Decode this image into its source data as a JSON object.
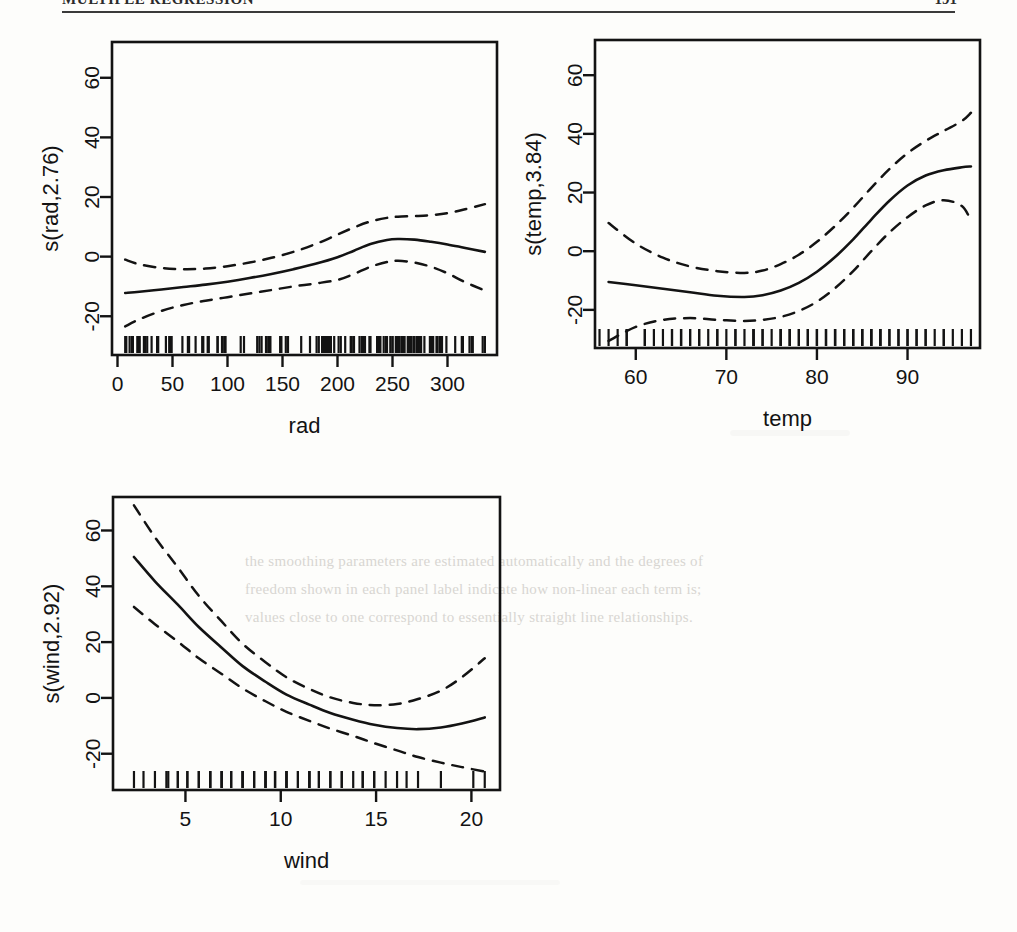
{
  "page": {
    "running_header": "MULTIPLE REGRESSION",
    "page_number": "191",
    "bleed_text_line1": "the smoothing parameters are estimated automatically and the degrees of",
    "bleed_text_line2": "freedom shown in each panel label indicate how non-linear each term is;",
    "bleed_text_line3": "values close to one correspond to essentially straight line relationships."
  },
  "chart_data": [
    {
      "type": "line",
      "id": "rad-panel",
      "title": "",
      "xlabel": "rad",
      "ylabel": "s(rad,2.76)",
      "xlim": [
        -5,
        345
      ],
      "ylim": [
        -33,
        72
      ],
      "xticks": [
        0,
        50,
        100,
        150,
        200,
        250,
        300
      ],
      "yticks": [
        -20,
        0,
        20,
        40,
        60
      ],
      "grid": false,
      "legend": "none",
      "rug": true,
      "series": [
        {
          "name": "smooth",
          "style": "solid",
          "x": [
            7,
            20,
            40,
            60,
            80,
            100,
            120,
            140,
            160,
            180,
            200,
            215,
            230,
            245,
            255,
            270,
            285,
            300,
            315,
            334
          ],
          "y": [
            -12.2,
            -11.8,
            -11.0,
            -10.2,
            -9.4,
            -8.4,
            -7.2,
            -5.8,
            -4.2,
            -2.4,
            -0.2,
            2.0,
            4.2,
            5.6,
            5.9,
            5.7,
            5.0,
            4.1,
            3.0,
            1.6
          ]
        },
        {
          "name": "upper-se",
          "style": "dashed",
          "x": [
            7,
            20,
            40,
            60,
            80,
            100,
            120,
            140,
            160,
            180,
            200,
            215,
            230,
            245,
            255,
            270,
            285,
            300,
            315,
            334
          ],
          "y": [
            -1.0,
            -2.6,
            -3.8,
            -4.2,
            -4.0,
            -3.2,
            -2.0,
            -0.4,
            1.6,
            4.2,
            7.4,
            9.8,
            11.8,
            13.0,
            13.4,
            13.6,
            13.9,
            14.6,
            15.8,
            17.6
          ]
        },
        {
          "name": "lower-se",
          "style": "dashed",
          "x": [
            7,
            20,
            40,
            60,
            80,
            100,
            120,
            140,
            160,
            180,
            200,
            215,
            230,
            245,
            255,
            270,
            285,
            300,
            315,
            334
          ],
          "y": [
            -23.4,
            -21.0,
            -18.2,
            -16.2,
            -14.8,
            -13.6,
            -12.4,
            -11.2,
            -10.0,
            -9.0,
            -7.8,
            -5.8,
            -3.4,
            -1.8,
            -1.4,
            -2.0,
            -3.4,
            -5.6,
            -8.4,
            -11.4
          ]
        }
      ]
    },
    {
      "type": "line",
      "id": "temp-panel",
      "title": "",
      "xlabel": "temp",
      "ylabel": "s(temp,3.84)",
      "xlim": [
        55.5,
        98
      ],
      "ylim": [
        -33,
        72
      ],
      "xticks": [
        60,
        70,
        80,
        90
      ],
      "yticks": [
        -20,
        0,
        20,
        40,
        60
      ],
      "grid": false,
      "legend": "none",
      "rug": true,
      "series": [
        {
          "name": "smooth",
          "style": "solid",
          "x": [
            57,
            60,
            63,
            66,
            69,
            72,
            74,
            76,
            78,
            80,
            82,
            84,
            86,
            88,
            90,
            92,
            94,
            96,
            97
          ],
          "y": [
            -10.5,
            -11.6,
            -12.8,
            -14.0,
            -15.2,
            -15.6,
            -15.0,
            -13.4,
            -10.8,
            -7.0,
            -2.0,
            4.0,
            10.8,
            17.2,
            22.4,
            25.8,
            27.6,
            28.6,
            28.9
          ]
        },
        {
          "name": "upper-se",
          "style": "dashed",
          "x": [
            57,
            60,
            63,
            66,
            69,
            72,
            74,
            76,
            78,
            80,
            82,
            84,
            86,
            88,
            90,
            92,
            94,
            96,
            97
          ],
          "y": [
            9.6,
            2.6,
            -2.2,
            -5.2,
            -6.8,
            -7.4,
            -6.6,
            -4.4,
            -1.2,
            3.2,
            8.6,
            14.8,
            21.6,
            28.0,
            33.4,
            37.6,
            41.0,
            44.4,
            47.2
          ]
        },
        {
          "name": "lower-se",
          "style": "dashed",
          "x": [
            57,
            60,
            63,
            66,
            69,
            72,
            74,
            76,
            78,
            80,
            82,
            84,
            86,
            88,
            90,
            92,
            94,
            96,
            97
          ],
          "y": [
            -30.6,
            -25.8,
            -23.4,
            -22.8,
            -23.4,
            -23.8,
            -23.4,
            -22.4,
            -20.4,
            -17.2,
            -12.6,
            -6.8,
            0.0,
            6.4,
            11.6,
            15.6,
            17.4,
            15.4,
            10.4
          ]
        }
      ]
    },
    {
      "type": "line",
      "id": "wind-panel",
      "title": "",
      "xlabel": "wind",
      "ylabel": "s(wind,2.92)",
      "xlim": [
        1.2,
        21.5
      ],
      "ylim": [
        -33,
        72
      ],
      "xticks": [
        5,
        10,
        15,
        20
      ],
      "yticks": [
        -20,
        0,
        20,
        40,
        60
      ],
      "grid": false,
      "legend": "none",
      "rug": true,
      "series": [
        {
          "name": "smooth",
          "style": "solid",
          "x": [
            2.3,
            3.4,
            4.6,
            5.7,
            6.9,
            8.0,
            9.2,
            10.3,
            11.5,
            12.6,
            13.8,
            14.9,
            16.1,
            17.2,
            18.4,
            19.5,
            20.7
          ],
          "y": [
            50.5,
            41.8,
            33.4,
            25.4,
            18.0,
            11.4,
            5.8,
            1.2,
            -2.4,
            -5.4,
            -7.8,
            -9.6,
            -10.8,
            -11.2,
            -10.6,
            -9.2,
            -7.0
          ]
        },
        {
          "name": "upper-se",
          "style": "dashed",
          "x": [
            2.3,
            3.4,
            4.6,
            5.7,
            6.9,
            8.0,
            9.2,
            10.3,
            11.5,
            12.6,
            13.8,
            14.9,
            16.1,
            17.2,
            18.4,
            19.5,
            20.7
          ],
          "y": [
            69.0,
            57.6,
            46.8,
            36.6,
            27.4,
            19.4,
            12.8,
            7.4,
            3.2,
            0.2,
            -1.8,
            -2.6,
            -2.2,
            -0.4,
            2.6,
            7.4,
            14.2
          ]
        },
        {
          "name": "lower-se",
          "style": "dashed",
          "x": [
            2.3,
            3.4,
            4.6,
            5.7,
            6.9,
            8.0,
            9.2,
            10.3,
            11.5,
            12.6,
            13.8,
            14.9,
            16.1,
            17.2,
            18.4,
            19.5,
            20.7
          ],
          "y": [
            32.6,
            26.4,
            20.2,
            14.2,
            8.6,
            3.4,
            -1.2,
            -5.0,
            -8.2,
            -11.0,
            -13.6,
            -16.2,
            -18.8,
            -21.2,
            -23.2,
            -24.8,
            -26.4
          ]
        }
      ]
    }
  ],
  "rug_values": {
    "rad": [
      7,
      8,
      11,
      13,
      14,
      18,
      19,
      20,
      20,
      24,
      25,
      25,
      27,
      31,
      36,
      37,
      44,
      47,
      48,
      49,
      49,
      59,
      64,
      65,
      65,
      71,
      77,
      78,
      82,
      83,
      91,
      91,
      95,
      97,
      98,
      98,
      112,
      115,
      127,
      129,
      131,
      135,
      137,
      138,
      139,
      148,
      148,
      149,
      153,
      155,
      167,
      175,
      181,
      183,
      186,
      187,
      188,
      189,
      190,
      191,
      192,
      193,
      194,
      197,
      201,
      203,
      207,
      212,
      213,
      215,
      220,
      222,
      223,
      224,
      225,
      229,
      230,
      236,
      237,
      238,
      238,
      239,
      242,
      244,
      245,
      248,
      250,
      250,
      253,
      254,
      255,
      256,
      258,
      259,
      259,
      260,
      261,
      264,
      264,
      266,
      267,
      269,
      270,
      272,
      273,
      273,
      274,
      275,
      276,
      279,
      284,
      285,
      286,
      287,
      290,
      291,
      293,
      294,
      294,
      295,
      299,
      307,
      313,
      314,
      320,
      322,
      323,
      332,
      334
    ],
    "temp": [
      56,
      57,
      58,
      59,
      59,
      61,
      61,
      62,
      63,
      64,
      64,
      65,
      65,
      65,
      66,
      66,
      67,
      67,
      68,
      69,
      69,
      70,
      71,
      71,
      72,
      73,
      73,
      73,
      74,
      74,
      75,
      76,
      76,
      76,
      77,
      77,
      77,
      78,
      78,
      79,
      79,
      79,
      80,
      80,
      80,
      81,
      81,
      81,
      82,
      82,
      82,
      82,
      83,
      83,
      83,
      84,
      84,
      84,
      85,
      85,
      85,
      86,
      86,
      86,
      87,
      87,
      87,
      88,
      88,
      89,
      89,
      90,
      90,
      91,
      91,
      92,
      92,
      93,
      94,
      94,
      95,
      96,
      97
    ],
    "wind": [
      2.3,
      2.8,
      3.4,
      4.0,
      4.1,
      4.6,
      4.6,
      5.1,
      5.1,
      5.7,
      5.7,
      6.3,
      6.3,
      6.3,
      6.9,
      6.9,
      6.9,
      7.4,
      7.4,
      8.0,
      8.0,
      8.0,
      8.6,
      8.6,
      8.6,
      9.2,
      9.2,
      9.2,
      9.7,
      9.7,
      9.7,
      10.3,
      10.3,
      10.3,
      10.9,
      10.9,
      11.5,
      11.5,
      11.5,
      12.0,
      12.0,
      12.6,
      12.6,
      13.2,
      13.2,
      13.8,
      14.3,
      14.3,
      14.9,
      14.9,
      15.5,
      16.1,
      16.6,
      17.2,
      18.4,
      20.1,
      20.7
    ]
  }
}
